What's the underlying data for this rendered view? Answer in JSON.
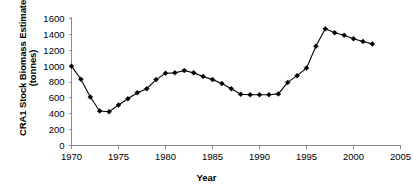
{
  "chart_data": {
    "type": "line",
    "title": "",
    "xlabel": "Year",
    "ylabel": "CRA1 Stock Biomass Estimate (tonnes)",
    "ylabel_line1": "CRA1 Stock Biomass Estimate",
    "ylabel_line2": "(tonnes)",
    "xlim": [
      1970,
      2005
    ],
    "ylim": [
      0,
      1600
    ],
    "xticks": [
      1970,
      1975,
      1980,
      1985,
      1990,
      1995,
      2000,
      2005
    ],
    "xtick_labels": [
      "1970",
      "1975",
      "1980",
      "1985",
      "1990",
      "1995",
      "2000",
      "2005"
    ],
    "yticks": [
      0,
      200,
      400,
      600,
      800,
      1000,
      1200,
      1400,
      1600
    ],
    "ytick_labels": [
      "0",
      "200",
      "400",
      "600",
      "800",
      "1000",
      "1200",
      "1400",
      "1600"
    ],
    "grid": false,
    "legend": false,
    "marker": "diamond",
    "line_color": "#000000",
    "marker_color": "#000000",
    "axis_color": "#8a8a8a",
    "x": [
      1970,
      1971,
      1972,
      1973,
      1974,
      1975,
      1976,
      1977,
      1978,
      1979,
      1980,
      1981,
      1982,
      1983,
      1984,
      1985,
      1986,
      1987,
      1988,
      1989,
      1990,
      1991,
      1992,
      1993,
      1994,
      1995,
      1996,
      1997,
      1998,
      1999,
      2000,
      2001,
      2002
    ],
    "values": [
      1000,
      835,
      610,
      435,
      425,
      510,
      590,
      665,
      715,
      830,
      910,
      915,
      945,
      915,
      870,
      830,
      780,
      715,
      645,
      640,
      640,
      640,
      650,
      795,
      880,
      975,
      1250,
      1470,
      1420,
      1390,
      1345,
      1310,
      1280
    ]
  },
  "figure": {
    "background_color": "#ffffff"
  }
}
